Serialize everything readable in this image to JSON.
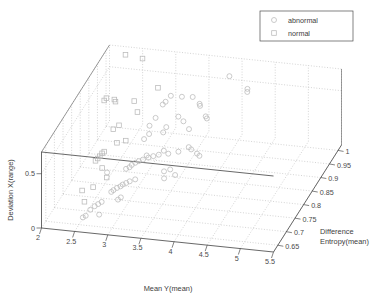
{
  "chart_data": {
    "type": "scatter",
    "projection": "3d",
    "title": "",
    "xlabel": "Mean Y(mean)",
    "ylabel": "Deviation X(range)",
    "zlabel_line1": "Difference",
    "zlabel_line2": "Entropy(mean)",
    "zlabel": "Difference Entropy(mean)",
    "xticks": [
      "5.5",
      "5",
      "4.5",
      "4",
      "3.5",
      "3",
      "2.5",
      "2"
    ],
    "xtick_values": [
      5.5,
      5,
      4.5,
      4,
      3.5,
      3,
      2.5,
      2
    ],
    "yticks": [
      "0",
      "0.5"
    ],
    "ytick_values": [
      0,
      0.5
    ],
    "zticks": [
      "0.65",
      "0.7",
      "0.75",
      "0.8",
      "0.85",
      "0.9",
      "0.95",
      "1"
    ],
    "ztick_values": [
      0.65,
      0.7,
      0.75,
      0.8,
      0.85,
      0.9,
      0.95,
      1
    ],
    "xlim": [
      2,
      5.5
    ],
    "ylim": [
      0,
      0.7
    ],
    "zlim": [
      0.625,
      1.02
    ],
    "grid": true,
    "legend_position": "top-right",
    "marker_color": "#b9b9b9",
    "axis_color": "#4d4d4d",
    "grid_color": "#b0b0b0",
    "series": [
      {
        "name": "abnormal",
        "marker": "circle",
        "points": [
          [
            3.9,
            0.62,
            0.985
          ],
          [
            4.25,
            0.6,
            0.955
          ],
          [
            4.26,
            0.585,
            0.95
          ],
          [
            3.45,
            0.5,
            0.945
          ],
          [
            3.3,
            0.505,
            0.94
          ],
          [
            3.58,
            0.47,
            0.935
          ],
          [
            3.6,
            0.465,
            0.93
          ],
          [
            3.12,
            0.49,
            0.945
          ],
          [
            3.08,
            0.47,
            0.93
          ],
          [
            3.05,
            0.455,
            0.925
          ],
          [
            3.35,
            0.425,
            0.9
          ],
          [
            3.44,
            0.4,
            0.895
          ],
          [
            3.55,
            0.36,
            0.885
          ],
          [
            3.22,
            0.37,
            0.88
          ],
          [
            3.2,
            0.345,
            0.87
          ],
          [
            3.02,
            0.405,
            0.895
          ],
          [
            2.98,
            0.38,
            0.875
          ],
          [
            3.0,
            0.33,
            0.865
          ],
          [
            2.95,
            0.305,
            0.855
          ],
          [
            3.65,
            0.3,
            0.845
          ],
          [
            3.7,
            0.295,
            0.84
          ],
          [
            3.8,
            0.275,
            0.835
          ],
          [
            3.85,
            0.27,
            0.83
          ],
          [
            3.52,
            0.275,
            0.835
          ],
          [
            3.38,
            0.26,
            0.83
          ],
          [
            3.3,
            0.27,
            0.835
          ],
          [
            3.25,
            0.255,
            0.825
          ],
          [
            3.18,
            0.25,
            0.82
          ],
          [
            3.12,
            0.245,
            0.815
          ],
          [
            3.08,
            0.25,
            0.82
          ],
          [
            3.05,
            0.235,
            0.81
          ],
          [
            3.0,
            0.23,
            0.805
          ],
          [
            2.96,
            0.225,
            0.8
          ],
          [
            2.92,
            0.215,
            0.795
          ],
          [
            2.9,
            0.205,
            0.79
          ],
          [
            2.86,
            0.2,
            0.785
          ],
          [
            3.6,
            0.19,
            0.785
          ],
          [
            3.46,
            0.175,
            0.775
          ],
          [
            3.05,
            0.165,
            0.765
          ],
          [
            2.98,
            0.155,
            0.76
          ],
          [
            2.94,
            0.15,
            0.755
          ],
          [
            2.9,
            0.145,
            0.75
          ],
          [
            2.88,
            0.14,
            0.745
          ],
          [
            2.84,
            0.135,
            0.74
          ],
          [
            2.8,
            0.125,
            0.735
          ],
          [
            2.78,
            0.12,
            0.73
          ],
          [
            2.95,
            0.105,
            0.72
          ],
          [
            2.92,
            0.095,
            0.715
          ],
          [
            2.7,
            0.085,
            0.705
          ],
          [
            2.66,
            0.075,
            0.7
          ],
          [
            2.62,
            0.065,
            0.695
          ],
          [
            2.58,
            0.055,
            0.685
          ],
          [
            2.74,
            0.045,
            0.675
          ],
          [
            2.55,
            0.035,
            0.67
          ],
          [
            2.52,
            0.03,
            0.665
          ],
          [
            3.75,
            0.44,
            0.905
          ],
          [
            3.78,
            0.435,
            0.9
          ],
          [
            3.5,
            0.21,
            0.795
          ],
          [
            3.42,
            0.2,
            0.79
          ],
          [
            2.6,
            0.175,
            0.775
          ]
        ]
      },
      {
        "name": "normal",
        "marker": "square",
        "points": [
          [
            2.55,
            0.66,
            1.0
          ],
          [
            2.28,
            0.665,
            1.005
          ],
          [
            2.9,
            0.525,
            0.955
          ],
          [
            2.62,
            0.46,
            0.925
          ],
          [
            2.35,
            0.45,
            0.92
          ],
          [
            2.32,
            0.455,
            0.925
          ],
          [
            2.72,
            0.415,
            0.905
          ],
          [
            2.52,
            0.355,
            0.875
          ],
          [
            2.46,
            0.34,
            0.865
          ],
          [
            2.7,
            0.3,
            0.845
          ],
          [
            2.58,
            0.285,
            0.84
          ],
          [
            2.44,
            0.245,
            0.82
          ],
          [
            2.42,
            0.24,
            0.815
          ],
          [
            2.4,
            0.225,
            0.81
          ],
          [
            2.38,
            0.215,
            0.805
          ],
          [
            2.36,
            0.205,
            0.8
          ],
          [
            2.5,
            0.185,
            0.785
          ],
          [
            2.62,
            0.155,
            0.765
          ],
          [
            2.48,
            0.12,
            0.74
          ],
          [
            2.34,
            0.105,
            0.73
          ],
          [
            2.44,
            0.07,
            0.705
          ],
          [
            2.2,
            0.46,
            0.925
          ],
          [
            2.18,
            0.45,
            0.92
          ]
        ]
      }
    ]
  },
  "legend": {
    "items": [
      {
        "label": "abnormal",
        "marker": "circle"
      },
      {
        "label": "normal",
        "marker": "square"
      }
    ]
  }
}
